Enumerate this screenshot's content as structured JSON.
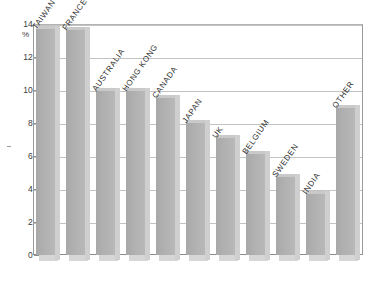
{
  "chart_data": {
    "type": "bar",
    "title": "",
    "subtitle": "",
    "xlabel": "",
    "ylabel": "%",
    "ylim": [
      0,
      14
    ],
    "ytick_labels": [
      "0",
      "2",
      "4",
      "6",
      "8",
      "10",
      "12",
      "14"
    ],
    "ytick_values": [
      0,
      2,
      4,
      6,
      8,
      10,
      12,
      14
    ],
    "grid": true,
    "legend": "none",
    "orientation": "vertical",
    "bar_style": "3d-shaded-grey",
    "label_rotation_degrees": -55,
    "categories": [
      "TAIWAN",
      "FRANCE",
      "AUSTRALIA",
      "HONG KONG",
      "CANADA",
      "JAPAN",
      "UK",
      "BELGIUM",
      "SWEDEN",
      "INDIA",
      "OTHER"
    ],
    "values": [
      13.9,
      13.8,
      10.1,
      10.1,
      9.7,
      8.2,
      7.3,
      6.3,
      4.9,
      3.9,
      9.1
    ],
    "series": [
      {
        "name": "share",
        "values": [
          13.9,
          13.8,
          10.1,
          10.1,
          9.7,
          8.2,
          7.3,
          6.3,
          4.9,
          3.9,
          9.1
        ]
      }
    ]
  },
  "axis": {
    "unit_symbol": "%"
  },
  "colors": {
    "bar_face": "#b0b0b0",
    "bar_top": "#c9c9c9",
    "bar_side": "#cfcfcf",
    "gridline": "#c3c3c3",
    "axis_line": "#8d8d8d",
    "text": "#2e2e2e",
    "background": "#ffffff"
  }
}
